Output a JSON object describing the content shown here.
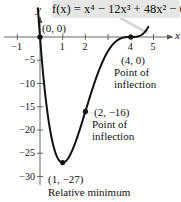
{
  "chart_data": {
    "type": "line",
    "function": {
      "name": "f(x)",
      "coefficients": {
        "x4": 1,
        "x3": -12,
        "x2": 48,
        "x1": -64,
        "x0": 0
      }
    },
    "xlabel": "x",
    "ylabel": "y",
    "xlim": [
      -1.7,
      5.8
    ],
    "ylim": [
      -32,
      3
    ],
    "x_ticks": [
      -1,
      1,
      2,
      3,
      4,
      5
    ],
    "x_tick_labels": [
      "−1",
      "1",
      "2",
      "",
      "4",
      "5"
    ],
    "y_ticks": [
      -5,
      -10,
      -15,
      -20,
      -25,
      -30
    ],
    "y_tick_labels": [
      "−5",
      "−10",
      "−15",
      "−20",
      "−25",
      "−30"
    ],
    "grid": false,
    "legend": null,
    "points": [
      {
        "x": 0,
        "y": 0,
        "label": "(0, 0)",
        "annotation": ""
      },
      {
        "x": 4,
        "y": 0,
        "label": "(4, 0)",
        "annotation": "Point of inflection"
      },
      {
        "x": 2,
        "y": -16,
        "label": "(2, −16)",
        "annotation": "Point of inflection"
      },
      {
        "x": 1,
        "y": -27,
        "label": "(1, −27)",
        "annotation": "Relative minimum"
      }
    ],
    "sample_curve": {
      "x": [
        -0.1,
        0,
        0.25,
        0.5,
        0.75,
        1,
        1.25,
        1.5,
        1.75,
        2,
        2.5,
        3,
        3.5,
        4,
        4.5,
        4.8
      ],
      "y": [
        6.53,
        0,
        -13.3,
        -21.94,
        -26.18,
        -27,
        -25.36,
        -22.19,
        -18.37,
        -16,
        -8.44,
        -3,
        -0.44,
        0,
        1.69,
        4.51
      ]
    }
  },
  "formula": {
    "lhs": "f(x) = ",
    "text": "f(x) = x⁴ − 12x³ + 48x² − 64x"
  },
  "axes": {
    "x_name": "x",
    "y_name": "y"
  },
  "annotations": {
    "origin": {
      "coord": "(0, 0)"
    },
    "p40": {
      "coord": "(4, 0)",
      "line1": "Point of",
      "line2": "inflection"
    },
    "p2m16": {
      "coord": "(2, −16)",
      "line1": "Point of",
      "line2": "inflection"
    },
    "p1m27": {
      "coord": "(1, −27)",
      "line1": "Relative minimum"
    }
  }
}
